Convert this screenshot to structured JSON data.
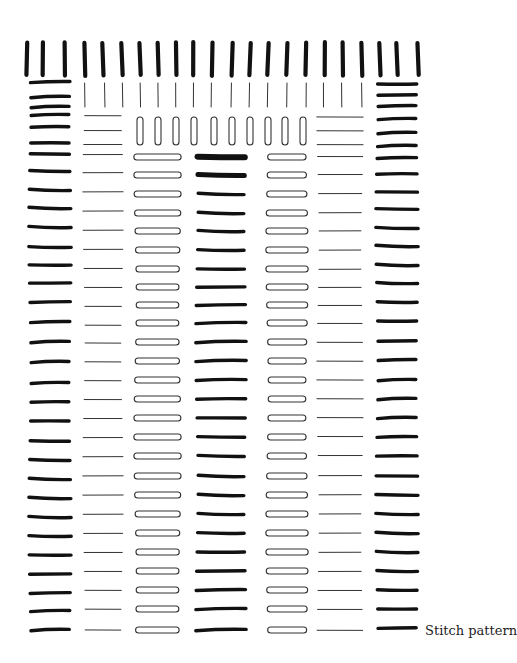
{
  "caption": "Stitch pattern",
  "colors": {
    "ink": "#111111",
    "thin": "#333333",
    "background": "#ffffff"
  },
  "top_row": {
    "description": "Thick vertical stitches across the top edge",
    "count": 22,
    "groups": [
      3,
      16,
      3
    ],
    "x": [
      27,
      43,
      65,
      85,
      103,
      122,
      140,
      158,
      176,
      193,
      212,
      232,
      250,
      268,
      287,
      306,
      325,
      343,
      362,
      380,
      397,
      418
    ],
    "y_top": 42,
    "y_bottom": 76
  },
  "thin_vertical_row": {
    "description": "Thin vertical stitches under top row",
    "count": 16,
    "groups": [
      3,
      10,
      3
    ],
    "x": [
      84,
      104,
      122,
      140,
      158,
      176,
      194,
      212,
      232,
      250,
      268,
      287,
      306,
      323,
      341,
      361
    ],
    "y_top": 83,
    "y_bottom": 107
  },
  "oval_vertical_row": {
    "description": "Outlined vertical oval stitches",
    "count": 10,
    "x": [
      140,
      158,
      176,
      194,
      214,
      232,
      250,
      268,
      285,
      303
    ],
    "y_top": 117,
    "y_bottom": 145
  },
  "columns": [
    {
      "name": "left-border",
      "style": "thick",
      "x1": 30,
      "x2": 70,
      "rows_y": [
        82,
        97,
        107,
        115,
        127,
        143,
        154,
        171,
        190,
        208,
        227,
        247,
        265,
        283,
        302,
        322,
        342,
        362,
        383,
        402,
        421,
        441,
        460,
        479,
        498,
        517,
        536,
        555,
        574,
        593,
        611,
        630
      ]
    },
    {
      "name": "thin-lines-left",
      "style": "thin",
      "x1": 84,
      "x2": 122,
      "rows_y": [
        116,
        131,
        145,
        155,
        173,
        192,
        211,
        230,
        249,
        268,
        287,
        306,
        325,
        343,
        362,
        381,
        400,
        419,
        438,
        457,
        476,
        495,
        514,
        533,
        552,
        571,
        590,
        609,
        630
      ]
    },
    {
      "name": "oval-horizontal-left",
      "style": "oval",
      "x1": 135,
      "x2": 180,
      "rows_y": [
        157,
        175,
        194,
        213,
        231,
        250,
        269,
        287,
        305,
        323,
        342,
        361,
        380,
        399,
        418,
        437,
        456,
        476,
        495,
        514,
        533,
        552,
        571,
        590,
        609,
        630
      ]
    },
    {
      "name": "center-thick",
      "style": "thick",
      "x1": 197,
      "x2": 245,
      "rows_y": [
        157,
        175,
        194,
        213,
        231,
        250,
        269,
        287,
        305,
        323,
        342,
        361,
        380,
        399,
        418,
        437,
        456,
        476,
        495,
        514,
        533,
        552,
        571,
        590,
        609,
        630
      ]
    },
    {
      "name": "oval-horizontal-right",
      "style": "oval",
      "x1": 267,
      "x2": 307,
      "rows_y": [
        157,
        175,
        194,
        213,
        231,
        250,
        269,
        287,
        305,
        323,
        342,
        361,
        380,
        399,
        418,
        437,
        456,
        476,
        495,
        514,
        533,
        552,
        571,
        590,
        609,
        630
      ]
    },
    {
      "name": "thin-lines-right",
      "style": "thin",
      "x1": 318,
      "x2": 362,
      "rows_y": [
        117,
        131,
        145,
        157,
        175,
        194,
        213,
        231,
        250,
        269,
        287,
        305,
        323,
        342,
        361,
        380,
        399,
        418,
        437,
        456,
        476,
        495,
        514,
        533,
        552,
        571,
        590,
        609,
        630
      ]
    },
    {
      "name": "right-border",
      "style": "thick",
      "x1": 377,
      "x2": 417,
      "rows_y": [
        84,
        95,
        106,
        119,
        133,
        146,
        158,
        174,
        192,
        209,
        228,
        246,
        265,
        283,
        302,
        321,
        341,
        360,
        380,
        399,
        418,
        437,
        456,
        476,
        495,
        514,
        533,
        552,
        571,
        590,
        609,
        628
      ]
    }
  ],
  "emphasized_strokes": [
    {
      "column": "center-thick",
      "row_index": 0,
      "weight": 6
    },
    {
      "column": "center-thick",
      "row_index": 1,
      "weight": 5
    }
  ]
}
